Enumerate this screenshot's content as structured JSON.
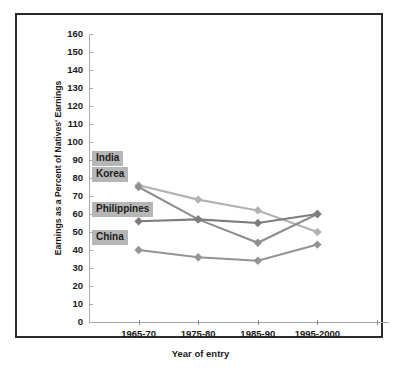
{
  "chart_data": {
    "type": "line",
    "title": "",
    "xlabel": "Year of entry",
    "ylabel": "Earnings as a Percent of Natives' Earnings",
    "categories": [
      "1965-70",
      "1975-80",
      "1985-90",
      "1995-2000"
    ],
    "ylim": [
      0,
      160
    ],
    "ytick_step": 10,
    "yticks": [
      "0",
      "10",
      "20",
      "30",
      "40",
      "50",
      "60",
      "70",
      "80",
      "90",
      "100",
      "110",
      "120",
      "130",
      "140",
      "150",
      "160"
    ],
    "grid": false,
    "legend_position": "inline-left-labels",
    "marker": "diamond",
    "series": [
      {
        "name": "India",
        "color": "#b2b2b2",
        "values": [
          76,
          68,
          62,
          50
        ]
      },
      {
        "name": "Korea",
        "color": "#8f8f8f",
        "values": [
          75,
          57,
          44,
          60
        ]
      },
      {
        "name": "Philippines",
        "color": "#7d7d7d",
        "values": [
          56,
          57,
          55,
          60
        ]
      },
      {
        "name": "China",
        "color": "#949494",
        "values": [
          40,
          36,
          34,
          43
        ]
      }
    ],
    "annotations": [
      {
        "text": "India",
        "value": 91
      },
      {
        "text": "Korea",
        "value": 82
      },
      {
        "text": "Philippines",
        "value": 63
      },
      {
        "text": "China",
        "value": 47
      }
    ]
  },
  "axis": {
    "y_label": "Earnings as a Percent of Natives' Earnings",
    "x_label": "Year of entry"
  },
  "colors": {
    "frame": "#2b2b2b",
    "axis": "#a9a9a9",
    "label_highlight": "#b6b6b6",
    "text": "#1a1a1a",
    "background": "#ffffff"
  }
}
